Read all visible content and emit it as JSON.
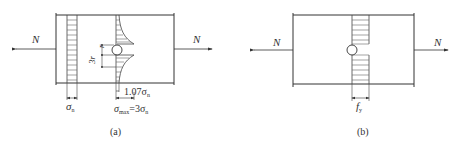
{
  "figure_a": {
    "caption": "(a)",
    "force_left": "N",
    "force_right": "N",
    "label_3r": "3r",
    "label_r": "r",
    "label_sigma_n": "σ",
    "label_sigma_n_sub": "n",
    "label_107": "1.07σ",
    "label_107_sub": "n",
    "label_max_sigma": "σ",
    "label_max_sub": "max",
    "label_max_eq": "=3σ",
    "label_max_eq_sub": "n"
  },
  "figure_b": {
    "caption": "(b)",
    "force_left": "N",
    "force_right": "N",
    "label_fy": "f",
    "label_fy_sub": "y"
  },
  "colors": {
    "line": "#333333",
    "hatch": "#555555",
    "background": "#ffffff"
  }
}
